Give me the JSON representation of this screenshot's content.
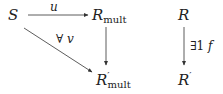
{
  "diagram": {
    "left": {
      "nodes": {
        "S": {
          "base": "S",
          "sub": "",
          "prime": ""
        },
        "R_mult": {
          "base": "R",
          "sub": "mult",
          "prime": ""
        },
        "R_prime_mult": {
          "base": "R",
          "sub": "mult",
          "prime": "′"
        }
      },
      "arrows": [
        {
          "from": "S",
          "to": "R_mult",
          "label": "u"
        },
        {
          "from": "R_mult",
          "to": "R_prime_mult",
          "label": ""
        },
        {
          "from": "S",
          "to": "R_prime_mult",
          "label_quant": "∀",
          "label_var": "v"
        }
      ]
    },
    "right": {
      "nodes": {
        "R": {
          "base": "R",
          "prime": ""
        },
        "R_prime": {
          "base": "R",
          "prime": "′"
        }
      },
      "arrows": [
        {
          "from": "R",
          "to": "R_prime",
          "label_quant": "∃1",
          "label_var": "f"
        }
      ]
    }
  }
}
